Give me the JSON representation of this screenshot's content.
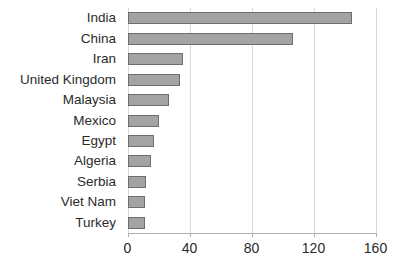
{
  "chart_data": {
    "type": "bar",
    "orientation": "horizontal",
    "title": "",
    "subtitle": "",
    "xlabel": "",
    "ylabel": "",
    "categories": [
      "India",
      "China",
      "Iran",
      "United Kingdom",
      "Malaysia",
      "Mexico",
      "Egypt",
      "Algeria",
      "Serbia",
      "Viet Nam",
      "Turkey"
    ],
    "values": [
      145,
      107,
      36,
      34,
      27,
      20,
      17,
      15,
      12,
      11,
      11
    ],
    "xlim": [
      0,
      160
    ],
    "xticks": [
      0,
      40,
      80,
      120,
      160
    ],
    "xtick_labels": [
      "0",
      "40",
      "80",
      "120",
      "160"
    ],
    "grid": "vertical",
    "legend": "none",
    "series": [
      {
        "name": "",
        "values": [
          145,
          107,
          36,
          34,
          27,
          20,
          17,
          15,
          12,
          11,
          11
        ]
      }
    ],
    "colors": {
      "bar_fill": "#a3a3a3",
      "bar_border": "#6e6e6e",
      "gridline": "#d9d9d9",
      "axis": "#b0b0b0",
      "text": "#2b2b2b",
      "background": "#ffffff"
    }
  }
}
